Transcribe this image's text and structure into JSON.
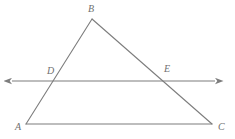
{
  "figure": {
    "background_color": "#ffffff",
    "stroke_color": "#7d7d7d",
    "label_color": "#6f6f6f",
    "stroke_width": 1.1,
    "width": 235,
    "height": 139
  },
  "points": {
    "A": {
      "label": "A",
      "x": 26,
      "y": 124,
      "label_x": 15,
      "label_y": 122
    },
    "B": {
      "label": "B",
      "x": 92,
      "y": 19,
      "label_x": 88,
      "label_y": 4
    },
    "C": {
      "label": "C",
      "x": 212,
      "y": 124,
      "label_x": 218,
      "label_y": 122
    },
    "D": {
      "label": "D",
      "x": 58,
      "y": 81,
      "label_x": 47,
      "label_y": 66
    },
    "E": {
      "label": "E",
      "x": 163,
      "y": 81,
      "label_x": 164,
      "label_y": 64
    }
  },
  "segments": [
    {
      "name": "side-AB",
      "from": "A",
      "to": "B"
    },
    {
      "name": "side-BC",
      "from": "B",
      "to": "C"
    },
    {
      "name": "side-AC",
      "from": "A",
      "to": "C"
    }
  ],
  "transversal": {
    "name": "line-DE",
    "y": 81,
    "x_start": 12,
    "x_end": 215,
    "arrow_left": true,
    "arrow_right": true,
    "passes_through": [
      "D",
      "E"
    ]
  }
}
